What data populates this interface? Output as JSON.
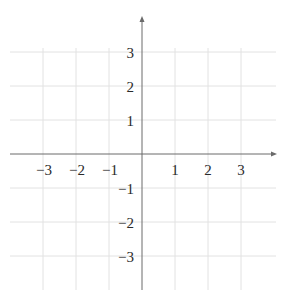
{
  "chart_data": {
    "type": "scatter",
    "title": "",
    "xlabel": "",
    "ylabel": "",
    "xlim": [
      -4,
      4
    ],
    "ylim": [
      -4,
      4
    ],
    "grid": true,
    "legend": null,
    "series": [],
    "x_ticks": [
      -3,
      -2,
      -1,
      1,
      2,
      3
    ],
    "y_ticks": [
      3,
      2,
      1,
      -1,
      -2,
      -3
    ],
    "x_tick_labels": [
      "−3",
      "−2",
      "−1",
      "1",
      "2",
      "3"
    ],
    "y_tick_labels": [
      "3",
      "2",
      "1",
      "−1",
      "−2",
      "−3"
    ],
    "axes": {
      "x_arrow": true,
      "y_arrow": true,
      "origin_label": ""
    }
  },
  "colors": {
    "grid": "#e2e2e2",
    "axis": "#6a6a6a",
    "text": "#2a2a2a",
    "background": "#ffffff"
  }
}
